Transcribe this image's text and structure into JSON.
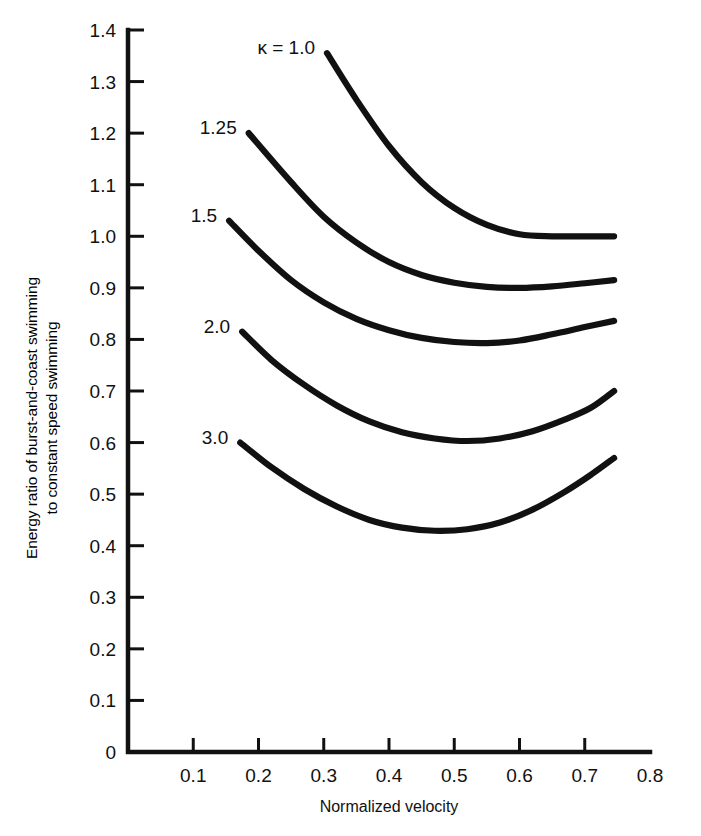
{
  "chart_data": {
    "type": "line",
    "title": "",
    "xlabel": "Normalized velocity",
    "ylabel_line1": "Energy ratio of burst-and-coast swimming",
    "ylabel_line2": "to constant speed swimming",
    "xlim": [
      0.0,
      0.8
    ],
    "ylim": [
      0.0,
      1.4
    ],
    "xticks": [
      0.1,
      0.2,
      0.3,
      0.4,
      0.5,
      0.6,
      0.7,
      0.8
    ],
    "xticklabels": [
      "0.1",
      "0.2",
      "0.3",
      "0.4",
      "0.5",
      "0.6",
      "0.7",
      "0.8"
    ],
    "yticks": [
      0,
      0.1,
      0.2,
      0.3,
      0.4,
      0.5,
      0.6,
      0.7,
      0.8,
      0.9,
      1.0,
      1.1,
      1.2,
      1.3,
      1.4
    ],
    "yticklabels": [
      "0",
      "0.1",
      "0.2",
      "0.3",
      "0.4",
      "0.5",
      "0.6",
      "0.7",
      "0.8",
      "0.9",
      "1.0",
      "1.1",
      "1.2",
      "1.3",
      "1.4"
    ],
    "grid": false,
    "legend_position": "inline-curve-labels",
    "legend_prefix": "κ =",
    "line_color": "#111111",
    "series": [
      {
        "name": "κ = 1.0",
        "label": "1.0",
        "label_prefix": "κ =",
        "x": [
          0.305,
          0.35,
          0.4,
          0.45,
          0.5,
          0.55,
          0.6,
          0.65,
          0.7,
          0.745
        ],
        "y": [
          1.355,
          1.265,
          1.175,
          1.105,
          1.055,
          1.022,
          1.004,
          1.0,
          1.0,
          1.0
        ]
      },
      {
        "name": "κ = 1.25",
        "label": "1.25",
        "x": [
          0.185,
          0.25,
          0.3,
          0.35,
          0.4,
          0.45,
          0.5,
          0.55,
          0.6,
          0.65,
          0.7,
          0.745
        ],
        "y": [
          1.2,
          1.105,
          1.038,
          0.988,
          0.95,
          0.925,
          0.91,
          0.902,
          0.9,
          0.903,
          0.909,
          0.915
        ]
      },
      {
        "name": "κ = 1.5",
        "label": "1.5",
        "x": [
          0.155,
          0.2,
          0.25,
          0.3,
          0.35,
          0.4,
          0.45,
          0.5,
          0.55,
          0.6,
          0.65,
          0.7,
          0.745
        ],
        "y": [
          1.03,
          0.972,
          0.915,
          0.872,
          0.84,
          0.818,
          0.803,
          0.795,
          0.793,
          0.798,
          0.81,
          0.824,
          0.836
        ]
      },
      {
        "name": "κ = 2.0",
        "label": "2.0",
        "x": [
          0.175,
          0.22,
          0.27,
          0.32,
          0.37,
          0.42,
          0.47,
          0.52,
          0.57,
          0.62,
          0.67,
          0.71,
          0.745
        ],
        "y": [
          0.815,
          0.76,
          0.712,
          0.672,
          0.641,
          0.62,
          0.608,
          0.603,
          0.608,
          0.622,
          0.645,
          0.668,
          0.7
        ]
      },
      {
        "name": "κ = 3.0",
        "label": "3.0",
        "x": [
          0.172,
          0.22,
          0.27,
          0.32,
          0.37,
          0.42,
          0.47,
          0.52,
          0.57,
          0.62,
          0.67,
          0.71,
          0.745
        ],
        "y": [
          0.6,
          0.552,
          0.51,
          0.476,
          0.45,
          0.435,
          0.429,
          0.432,
          0.445,
          0.47,
          0.505,
          0.538,
          0.57
        ]
      }
    ]
  }
}
